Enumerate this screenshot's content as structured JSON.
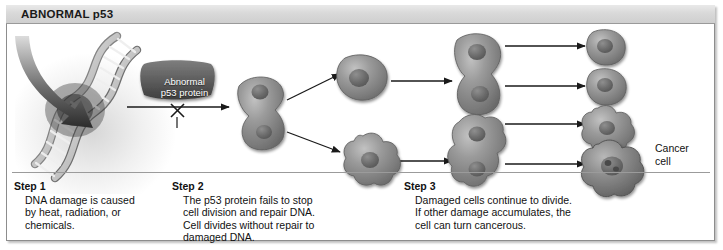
{
  "figure": {
    "title": "ABNORMAL p53",
    "accent_frame_color": "#8d8d8d",
    "titlebar_color": "#d9d9d9",
    "cell_color": "#8a8a8a",
    "ink_color": "#111111"
  },
  "labels": {
    "protein_line1": "Abnormal",
    "protein_line2": "p53 protein",
    "protein_blocked_marker": "X",
    "cancer_cell": "Cancer\ncell"
  },
  "steps": [
    {
      "head": "Step 1",
      "body": "DNA damage is caused\nby heat, radiation, or\nchemicals."
    },
    {
      "head": "Step 2",
      "body": "The p53 protein fails to stop\ncell division and repair DNA.\nCell divides without repair to\ndamaged DNA."
    },
    {
      "head": "Step 3",
      "body": "Damaged cells continue to divide.\nIf other damage accumulates, the\ncell can turn cancerous."
    }
  ],
  "diagram": {
    "damage_arrow": "curved-arrow-to-dna",
    "dna": "dna-double-helix",
    "stage1_cell": "dividing-cell-pair",
    "stage2_cells": [
      "round-cell",
      "lobed-cell"
    ],
    "stage3_cells": [
      "dividing-cell-pair",
      "dividing-lobed-cell-pair"
    ],
    "final_cells": [
      "round-cell",
      "round-cell",
      "lobed-cell",
      "cancer-cell"
    ],
    "arrow_count": 8
  }
}
